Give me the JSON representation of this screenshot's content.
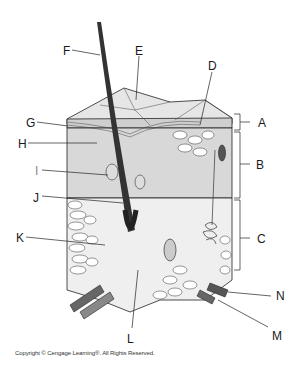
{
  "diagram": {
    "labels": [
      {
        "id": "A",
        "text": "A",
        "x": 258,
        "y": 117
      },
      {
        "id": "B",
        "text": "B",
        "x": 256,
        "y": 159
      },
      {
        "id": "C",
        "text": "C",
        "x": 257,
        "y": 233
      },
      {
        "id": "D",
        "text": "D",
        "x": 208,
        "y": 60
      },
      {
        "id": "E",
        "text": "E",
        "x": 135,
        "y": 45
      },
      {
        "id": "F",
        "text": "F",
        "x": 63,
        "y": 45
      },
      {
        "id": "G",
        "text": "G",
        "x": 26,
        "y": 117
      },
      {
        "id": "H",
        "text": "H",
        "x": 18,
        "y": 138
      },
      {
        "id": "I",
        "text": "I",
        "x": 35,
        "y": 166
      },
      {
        "id": "J",
        "text": "J",
        "x": 33,
        "y": 192
      },
      {
        "id": "K",
        "text": "K",
        "x": 16,
        "y": 232
      },
      {
        "id": "L",
        "text": "L",
        "x": 127,
        "y": 333
      },
      {
        "id": "M",
        "text": "M",
        "x": 272,
        "y": 330
      },
      {
        "id": "N",
        "text": "N",
        "x": 276,
        "y": 292
      }
    ]
  },
  "footer": {
    "copyright": "Copyright © Cengage Learning®. All Rights Reserved."
  }
}
